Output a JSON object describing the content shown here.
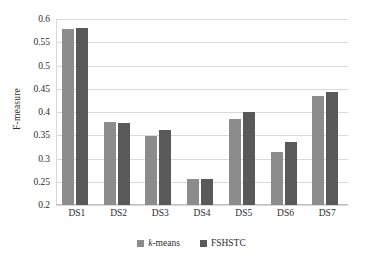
{
  "chart_data": {
    "type": "bar",
    "title": "",
    "xlabel": "",
    "ylabel": "F-measure",
    "categories": [
      "DS1",
      "DS2",
      "DS3",
      "DS4",
      "DS5",
      "DS6",
      "DS7"
    ],
    "series": [
      {
        "name": "k-means",
        "color": "#8c8c8c",
        "values": [
          0.578,
          0.378,
          0.348,
          0.257,
          0.386,
          0.314,
          0.434
        ]
      },
      {
        "name": "FSHSTC",
        "color": "#595959",
        "values": [
          0.58,
          0.377,
          0.362,
          0.255,
          0.4,
          0.335,
          0.443
        ]
      }
    ],
    "ylim": [
      0.2,
      0.6
    ],
    "ytick_labels": [
      "0.2",
      "0.25",
      "0.3",
      "0.35",
      "0.4",
      "0.45",
      "0.5",
      "0.55",
      "0.6"
    ],
    "ytick_values": [
      0.2,
      0.25,
      0.3,
      0.35,
      0.4,
      0.45,
      0.5,
      0.55,
      0.6
    ],
    "grid": "horizontal",
    "legend_position": "bottom",
    "legend_entries": [
      "k-means",
      "FSHSTC"
    ]
  },
  "legend": {
    "items": [
      {
        "label_prefix": "k",
        "label_suffix": "-means",
        "color": "#8c8c8c"
      },
      {
        "label_prefix": "",
        "label_suffix": "FSHSTC",
        "color": "#595959"
      }
    ]
  },
  "axis": {
    "y_title": "F-measure"
  },
  "colors": {
    "series_1": "#8c8c8c",
    "series_2": "#595959",
    "gridline": "#d9d9d9",
    "text": "#2b2b2b",
    "background": "#ffffff"
  }
}
